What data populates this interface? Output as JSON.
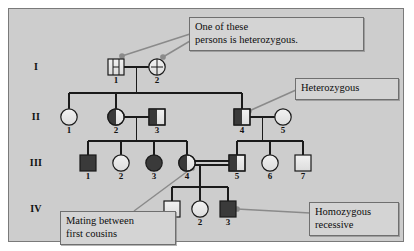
{
  "figure": {
    "type": "pedigree-chart",
    "background_color": "#cdcdcd",
    "page_color": "#ffffff",
    "symbol_fill_open": "#e6e6e6",
    "symbol_fill_solid": "#3a3a3a",
    "symbol_stroke": "#1a1a1a",
    "line_color": "#1a1a1a",
    "leader_color": "#8a8a8a"
  },
  "generations": [
    {
      "label": "I"
    },
    {
      "label": "II"
    },
    {
      "label": "III"
    },
    {
      "label": "IV"
    }
  ],
  "individuals": [
    {
      "id": "I-1",
      "generation": "I",
      "number": "1",
      "sex": "male",
      "fill": "vertical-line",
      "x": 116,
      "y": 67
    },
    {
      "id": "I-2",
      "generation": "I",
      "number": "2",
      "sex": "female",
      "fill": "vertical-line",
      "x": 157,
      "y": 67
    },
    {
      "id": "II-1",
      "generation": "II",
      "number": "1",
      "sex": "female",
      "fill": "open",
      "x": 69,
      "y": 117
    },
    {
      "id": "II-2",
      "generation": "II",
      "number": "2",
      "sex": "female",
      "fill": "half-left",
      "x": 116,
      "y": 117
    },
    {
      "id": "II-3",
      "generation": "II",
      "number": "3",
      "sex": "male",
      "fill": "half-left",
      "x": 157,
      "y": 117
    },
    {
      "id": "II-4",
      "generation": "II",
      "number": "4",
      "sex": "male",
      "fill": "half-left",
      "x": 242,
      "y": 117
    },
    {
      "id": "II-5",
      "generation": "II",
      "number": "5",
      "sex": "female",
      "fill": "open",
      "x": 283,
      "y": 117
    },
    {
      "id": "III-1",
      "generation": "III",
      "number": "1",
      "sex": "male",
      "fill": "solid",
      "x": 88,
      "y": 163
    },
    {
      "id": "III-2",
      "generation": "III",
      "number": "2",
      "sex": "female",
      "fill": "open",
      "x": 121,
      "y": 163
    },
    {
      "id": "III-3",
      "generation": "III",
      "number": "3",
      "sex": "female",
      "fill": "solid",
      "x": 154,
      "y": 163
    },
    {
      "id": "III-4",
      "generation": "III",
      "number": "4",
      "sex": "female",
      "fill": "half-left",
      "x": 187,
      "y": 163
    },
    {
      "id": "III-5",
      "generation": "III",
      "number": "5",
      "sex": "male",
      "fill": "half-left",
      "x": 237,
      "y": 163
    },
    {
      "id": "III-6",
      "generation": "III",
      "number": "6",
      "sex": "female",
      "fill": "open",
      "x": 270,
      "y": 163
    },
    {
      "id": "III-7",
      "generation": "III",
      "number": "7",
      "sex": "male",
      "fill": "open",
      "x": 303,
      "y": 163
    },
    {
      "id": "IV-1",
      "generation": "IV",
      "number": "1",
      "sex": "male",
      "fill": "open",
      "x": 172,
      "y": 209
    },
    {
      "id": "IV-2",
      "generation": "IV",
      "number": "2",
      "sex": "female",
      "fill": "open",
      "x": 200,
      "y": 209
    },
    {
      "id": "IV-3",
      "generation": "IV",
      "number": "3",
      "sex": "male",
      "fill": "solid",
      "x": 228,
      "y": 209
    }
  ],
  "matings": [
    {
      "partners": [
        "I-1",
        "I-2"
      ],
      "consanguineous": false
    },
    {
      "partners": [
        "II-2",
        "II-3"
      ],
      "consanguineous": false
    },
    {
      "partners": [
        "II-4",
        "II-5"
      ],
      "consanguineous": false
    },
    {
      "partners": [
        "III-4",
        "III-5"
      ],
      "consanguineous": true
    }
  ],
  "callouts": {
    "heterozygous_parents": {
      "name": "one-of-these-persons-is-heterozygous",
      "lines": [
        "One of these",
        "persons is heterozygous."
      ],
      "points_to": [
        "I-1",
        "I-2"
      ]
    },
    "heterozygous": {
      "name": "heterozygous",
      "lines": [
        "Heterozygous"
      ],
      "points_to": [
        "II-4"
      ]
    },
    "homozygous_recessive": {
      "name": "homozygous-recessive",
      "lines": [
        "Homozygous",
        "recessive"
      ],
      "points_to": [
        "IV-3"
      ]
    },
    "first_cousins": {
      "name": "mating-between-first-cousins",
      "lines": [
        "Mating between",
        "first cousins"
      ],
      "points_to": [
        "III-4",
        "III-5"
      ]
    }
  }
}
